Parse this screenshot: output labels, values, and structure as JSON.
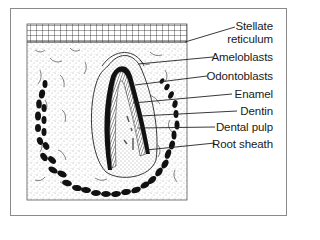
{
  "figure": {
    "type": "tooth-germ-cross-section",
    "line_color": "#1a1a1a",
    "frame_color": "#8a8a8a"
  },
  "labels": [
    {
      "id": "stellate-reticulum",
      "line1": "Stellate",
      "line2": "reticulum"
    },
    {
      "id": "ameloblasts",
      "line1": "Ameloblasts"
    },
    {
      "id": "odontoblasts",
      "line1": "Odontoblasts"
    },
    {
      "id": "enamel",
      "line1": "Enamel"
    },
    {
      "id": "dentin",
      "line1": "Dentin"
    },
    {
      "id": "dental-pulp",
      "line1": "Dental pulp"
    },
    {
      "id": "root-sheath",
      "line1": "Root sheath"
    }
  ]
}
